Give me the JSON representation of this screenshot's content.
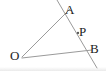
{
  "figure": {
    "background_color": "#ffffff",
    "width": 106,
    "height": 71,
    "line_color": "#9a9a9a",
    "label_color": "#232323",
    "point_color": "#555555"
  },
  "labels": {
    "A": "A",
    "P": "P",
    "B": "B",
    "O": "O"
  },
  "chart_data": {
    "type": "diagram",
    "subtype": "euclidean-geometry",
    "points": [
      {
        "name": "O",
        "x": 22,
        "y": 57,
        "role": "vertex",
        "marked": false
      },
      {
        "name": "A",
        "x": 62,
        "y": 16,
        "role": "intersection",
        "marked": false
      },
      {
        "name": "P",
        "x": 78,
        "y": 33,
        "role": "point-on-segment",
        "marked": true
      },
      {
        "name": "B",
        "x": 88,
        "y": 51,
        "role": "intersection",
        "marked": false
      }
    ],
    "segments": [
      {
        "name": "ray-OA",
        "from": "O",
        "to": "A",
        "x1": 22,
        "y1": 57,
        "x2": 70,
        "y2": 9,
        "style": "solid"
      },
      {
        "name": "ray-OB",
        "from": "O",
        "to": "B",
        "x1": 22,
        "y1": 58,
        "x2": 92,
        "y2": 50,
        "style": "solid"
      },
      {
        "name": "transversal-AB",
        "from": "A",
        "to": "B",
        "x1": 57,
        "y1": 0,
        "x2": 97,
        "y2": 68,
        "style": "solid"
      }
    ],
    "axis_labels": {
      "x": "",
      "y": ""
    },
    "grid": false,
    "legend": null
  }
}
